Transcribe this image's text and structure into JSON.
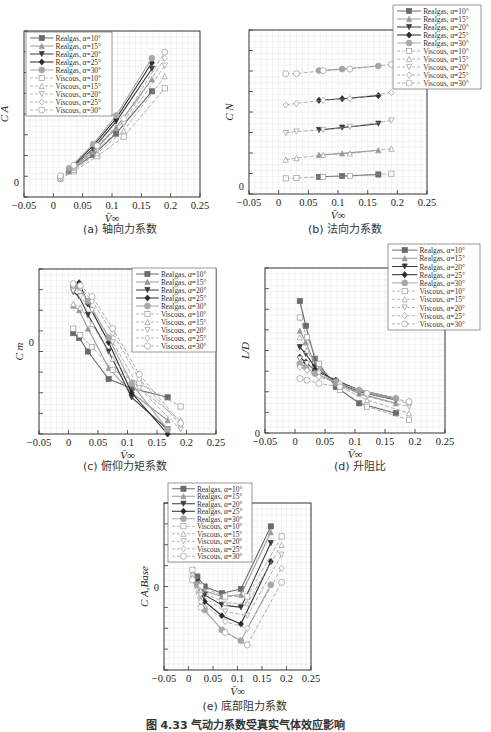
{
  "figure_caption": "图 4.33  气动力系数受真实气体效应影响",
  "legend_entries": [
    "Realgas, α=10°",
    "Realgas, α=15°",
    "Realgas, α=20°",
    "Realgas, α=25°",
    "Realgas, α=30°",
    "Viscous, α=10°",
    "Viscous, α=15°",
    "Viscous, α=20°",
    "Viscous, α=25°",
    "Viscous, α=30°"
  ],
  "series_styles": {
    "colors": [
      "#6a6a6a",
      "#9a9a9a",
      "#3a3a3a",
      "#2a2a2a",
      "#a8a8a8"
    ],
    "markers": [
      "square",
      "triangle",
      "triangle-down",
      "diamond",
      "circle"
    ]
  },
  "x_ticks": [
    "-0.05",
    "0",
    "0.05",
    "0.1",
    "0.15",
    "0.2",
    "0.25"
  ],
  "chart_data": [
    {
      "id": "a",
      "type": "line",
      "title": "(a) 轴向力系数",
      "xlabel": "V̄∞",
      "ylabel": "C_A",
      "xlim": [
        -0.05,
        0.25
      ],
      "ylim": [
        -0.1,
        1.0
      ],
      "y_tick_labels": [
        {
          "value": 0,
          "label": "0"
        }
      ],
      "grid": true,
      "legend_position": "upper-left",
      "x_real": [
        0.027,
        0.068,
        0.107,
        0.168
      ],
      "x_viscous": [
        0.012,
        0.035,
        0.075,
        0.12,
        0.19
      ],
      "series": [
        {
          "name": "Realgas, α=10°",
          "values": [
            0.07,
            0.18,
            0.32,
            0.6
          ]
        },
        {
          "name": "Realgas, α=15°",
          "values": [
            0.075,
            0.2,
            0.36,
            0.68
          ]
        },
        {
          "name": "Realgas, α=20°",
          "values": [
            0.08,
            0.22,
            0.4,
            0.75
          ]
        },
        {
          "name": "Realgas, α=25°",
          "values": [
            0.085,
            0.24,
            0.42,
            0.79
          ]
        },
        {
          "name": "Realgas, α=30°",
          "values": [
            0.09,
            0.25,
            0.44,
            0.82
          ]
        },
        {
          "name": "Viscous, α=10°",
          "values": [
            0.02,
            0.07,
            0.17,
            0.3,
            0.62
          ]
        },
        {
          "name": "Viscous, α=15°",
          "values": [
            0.025,
            0.08,
            0.19,
            0.34,
            0.7
          ]
        },
        {
          "name": "Viscous, α=20°",
          "values": [
            0.03,
            0.09,
            0.21,
            0.38,
            0.77
          ]
        },
        {
          "name": "Viscous, α=25°",
          "values": [
            0.035,
            0.1,
            0.23,
            0.4,
            0.82
          ]
        },
        {
          "name": "Viscous, α=30°",
          "values": [
            0.04,
            0.11,
            0.24,
            0.42,
            0.86
          ]
        }
      ]
    },
    {
      "id": "b",
      "type": "line",
      "title": "(b) 法向力系数",
      "xlabel": "V̄∞",
      "ylabel": "C_N",
      "xlim": [
        -0.05,
        0.25
      ],
      "ylim": [
        -0.05,
        1.0
      ],
      "y_tick_labels": [
        {
          "value": 0,
          "label": "0"
        }
      ],
      "grid": true,
      "legend_position": "upper-right (outside)",
      "x_real": [
        0.068,
        0.107,
        0.168
      ],
      "x_viscous": [
        0.012,
        0.03,
        0.075,
        0.12,
        0.19
      ],
      "series": [
        {
          "name": "Realgas, α=10°",
          "values": [
            0.06,
            0.065,
            0.075
          ]
        },
        {
          "name": "Realgas, α=15°",
          "values": [
            0.2,
            0.21,
            0.23
          ]
        },
        {
          "name": "Realgas, α=20°",
          "values": [
            0.36,
            0.375,
            0.4
          ]
        },
        {
          "name": "Realgas, α=25°",
          "values": [
            0.55,
            0.56,
            0.58
          ]
        },
        {
          "name": "Realgas, α=30°",
          "values": [
            0.74,
            0.75,
            0.77
          ]
        },
        {
          "name": "Viscous, α=10°",
          "values": [
            0.05,
            0.052,
            0.06,
            0.065,
            0.08
          ]
        },
        {
          "name": "Viscous, α=15°",
          "values": [
            0.17,
            0.18,
            0.2,
            0.21,
            0.24
          ]
        },
        {
          "name": "Viscous, α=20°",
          "values": [
            0.34,
            0.35,
            0.36,
            0.38,
            0.42
          ]
        },
        {
          "name": "Viscous, α=25°",
          "values": [
            0.52,
            0.53,
            0.55,
            0.56,
            0.6
          ]
        },
        {
          "name": "Viscous, α=30°",
          "values": [
            0.72,
            0.72,
            0.74,
            0.75,
            0.78
          ]
        }
      ]
    },
    {
      "id": "c",
      "type": "line",
      "title": "(c) 俯仰力矩系数",
      "xlabel": "V̄∞",
      "ylabel": "C_m",
      "xlim": [
        -0.05,
        0.25
      ],
      "ylim": [
        -1.0,
        0.8
      ],
      "y_tick_labels": [
        {
          "value": 0,
          "label": "0"
        }
      ],
      "grid": true,
      "legend_position": "upper-right",
      "x_real": [
        0.008,
        0.018,
        0.033,
        0.068,
        0.107,
        0.168
      ],
      "x_viscous": [
        0.008,
        0.02,
        0.04,
        0.075,
        0.12,
        0.19
      ],
      "series": [
        {
          "name": "Realgas, α=10°",
          "values": [
            0.1,
            0.05,
            -0.1,
            -0.4,
            -0.5,
            -0.6
          ]
        },
        {
          "name": "Realgas, α=15°",
          "values": [
            0.4,
            0.35,
            0.15,
            -0.28,
            -0.55,
            -0.85
          ]
        },
        {
          "name": "Realgas, α=20°",
          "values": [
            0.55,
            0.5,
            0.3,
            -0.1,
            -0.6,
            -0.95
          ]
        },
        {
          "name": "Realgas, α=25°",
          "values": [
            0.6,
            0.65,
            0.42,
            0.0,
            -0.55,
            -1.0
          ]
        },
        {
          "name": "Realgas, α=30°",
          "values": [
            0.62,
            0.6,
            0.45,
            0.05,
            -0.45,
            -0.95
          ]
        },
        {
          "name": "Viscous, α=10°",
          "values": [
            0.15,
            0.08,
            -0.05,
            -0.3,
            -0.45,
            -0.7
          ]
        },
        {
          "name": "Viscous, α=15°",
          "values": [
            0.42,
            0.38,
            0.2,
            -0.18,
            -0.5,
            -0.85
          ]
        },
        {
          "name": "Viscous, α=20°",
          "values": [
            0.56,
            0.5,
            0.35,
            0.0,
            -0.5,
            -0.95
          ]
        },
        {
          "name": "Viscous, α=25°",
          "values": [
            0.62,
            0.6,
            0.45,
            0.1,
            -0.4,
            -0.9
          ]
        },
        {
          "name": "Viscous, α=30°",
          "values": [
            0.64,
            0.62,
            0.5,
            0.15,
            -0.35,
            -0.88
          ]
        }
      ]
    },
    {
      "id": "d",
      "type": "line",
      "title": "(d) 升阻比",
      "xlabel": "V̄∞",
      "ylabel": "L/D",
      "xlim": [
        -0.05,
        0.25
      ],
      "ylim": [
        0,
        1.0
      ],
      "y_tick_labels": [
        {
          "value": 0,
          "label": "0"
        }
      ],
      "grid": true,
      "legend_position": "upper-right (outside)",
      "x_real": [
        0.008,
        0.018,
        0.033,
        0.068,
        0.107,
        0.168
      ],
      "x_viscous": [
        0.008,
        0.02,
        0.04,
        0.075,
        0.12,
        0.19
      ],
      "series": [
        {
          "name": "Realgas, α=10°",
          "values": [
            0.8,
            0.65,
            0.45,
            0.28,
            0.18,
            0.12
          ]
        },
        {
          "name": "Realgas, α=15°",
          "values": [
            0.62,
            0.55,
            0.42,
            0.3,
            0.24,
            0.18
          ]
        },
        {
          "name": "Realgas, α=20°",
          "values": [
            0.52,
            0.48,
            0.4,
            0.31,
            0.25,
            0.2
          ]
        },
        {
          "name": "Realgas, α=25°",
          "values": [
            0.46,
            0.43,
            0.38,
            0.32,
            0.26,
            0.21
          ]
        },
        {
          "name": "Realgas, α=30°",
          "values": [
            0.42,
            0.4,
            0.36,
            0.31,
            0.26,
            0.21
          ]
        },
        {
          "name": "Viscous, α=10°",
          "values": [
            0.7,
            0.58,
            0.42,
            0.26,
            0.16,
            0.08
          ]
        },
        {
          "name": "Viscous, α=15°",
          "values": [
            0.58,
            0.5,
            0.38,
            0.28,
            0.2,
            0.12
          ]
        },
        {
          "name": "Viscous, α=20°",
          "values": [
            0.45,
            0.42,
            0.36,
            0.29,
            0.22,
            0.16
          ]
        },
        {
          "name": "Viscous, α=25°",
          "values": [
            0.4,
            0.38,
            0.34,
            0.3,
            0.24,
            0.18
          ]
        },
        {
          "name": "Viscous, α=30°",
          "values": [
            0.33,
            0.32,
            0.3,
            0.28,
            0.24,
            0.19
          ]
        }
      ]
    },
    {
      "id": "e",
      "type": "line",
      "title": "(e) 底部阻力系数",
      "xlabel": "V̄∞",
      "ylabel": "C_A,Base",
      "xlim": [
        -0.05,
        0.25
      ],
      "ylim": [
        -1.0,
        1.0
      ],
      "y_tick_labels": [
        {
          "value": 0,
          "label": "0"
        }
      ],
      "grid": true,
      "legend_position": "upper-left (outside)",
      "x_real": [
        0.018,
        0.033,
        0.068,
        0.107,
        0.168
      ],
      "x_viscous": [
        0.008,
        0.025,
        0.075,
        0.12,
        0.19
      ],
      "series": [
        {
          "name": "Realgas, α=10°",
          "values": [
            0.12,
            0.0,
            -0.08,
            -0.03,
            0.72
          ]
        },
        {
          "name": "Realgas, α=15°",
          "values": [
            0.08,
            -0.05,
            -0.12,
            -0.1,
            0.65
          ]
        },
        {
          "name": "Realgas, α=20°",
          "values": [
            0.06,
            -0.1,
            -0.22,
            -0.25,
            0.52
          ]
        },
        {
          "name": "Realgas, α=25°",
          "values": [
            0.04,
            -0.18,
            -0.35,
            -0.45,
            0.3
          ]
        },
        {
          "name": "Realgas, α=30°",
          "values": [
            0.02,
            -0.28,
            -0.52,
            -0.65,
            0.02
          ]
        },
        {
          "name": "Viscous, α=10°",
          "values": [
            0.2,
            0.0,
            -0.12,
            -0.12,
            0.6
          ]
        },
        {
          "name": "Viscous, α=15°",
          "values": [
            0.15,
            -0.05,
            -0.2,
            -0.2,
            0.5
          ]
        },
        {
          "name": "Viscous, α=20°",
          "values": [
            0.12,
            -0.1,
            -0.3,
            -0.35,
            0.38
          ]
        },
        {
          "name": "Viscous, α=25°",
          "values": [
            0.1,
            -0.18,
            -0.42,
            -0.5,
            0.22
          ]
        },
        {
          "name": "Viscous, α=30°",
          "values": [
            0.08,
            -0.25,
            -0.55,
            -0.7,
            0.05
          ]
        }
      ]
    }
  ]
}
